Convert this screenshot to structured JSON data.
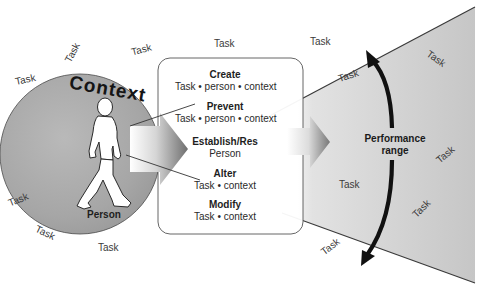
{
  "diagram": {
    "circle": {
      "title": "Context",
      "figure_label": "Person"
    },
    "box": {
      "items": [
        {
          "title": "Create",
          "sub": "Task • person • context"
        },
        {
          "title": "Prevent",
          "sub": "Task • person • context"
        },
        {
          "title": "Establish/Res",
          "sub": "Person"
        },
        {
          "title": "Alter",
          "sub": "Task • context"
        },
        {
          "title": "Modify",
          "sub": "Task • context"
        }
      ]
    },
    "performance": {
      "line1": "Performance",
      "line2": "range"
    },
    "task_label": "Task",
    "task_labels_count": 14,
    "icons": {
      "figure": "walking-person-icon",
      "circle_arrow": "arrow-right-icon",
      "box_arrow": "arrow-right-icon",
      "range_arrow": "double-headed-curved-arrow-icon"
    },
    "colors": {
      "circle_fill": "#a9a9a9",
      "funnel_fill": "#c4c4c4",
      "outline": "#3a3a3a",
      "arrow": "#111111"
    }
  }
}
